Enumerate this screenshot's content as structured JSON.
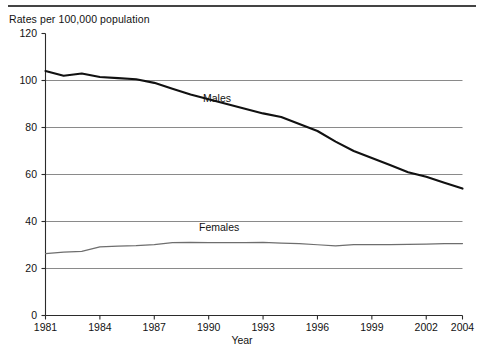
{
  "chart_data": {
    "type": "line",
    "title": "",
    "ylabel": "Rates per 100,000 population",
    "xlabel": "Year",
    "ylim": [
      0,
      120
    ],
    "xlim": [
      1981,
      2004
    ],
    "yticks": [
      0,
      20,
      40,
      60,
      80,
      100,
      120
    ],
    "xticks": [
      1981,
      1984,
      1987,
      1990,
      1993,
      1996,
      1999,
      2002,
      2004
    ],
    "xtick_labels": [
      "1981",
      "1984",
      "1987",
      "1990",
      "1993",
      "1996",
      "1999",
      "2002",
      "2004"
    ],
    "ytick_labels": [
      "0",
      "20",
      "40",
      "60",
      "80",
      "100",
      "120"
    ],
    "grid": "horizontal",
    "legend_position": "inline-annotation",
    "x": [
      1981,
      1982,
      1983,
      1984,
      1985,
      1986,
      1987,
      1988,
      1989,
      1990,
      1991,
      1992,
      1993,
      1994,
      1995,
      1996,
      1997,
      1998,
      1999,
      2000,
      2001,
      2002,
      2003,
      2004
    ],
    "series": [
      {
        "name": "Males",
        "color": "#111111",
        "width": 2.1,
        "values": [
          104,
          102,
          103,
          101.5,
          101,
          100.5,
          99,
          96.5,
          94,
          92,
          90,
          88,
          86,
          84.5,
          81.5,
          78.5,
          74,
          70,
          67,
          64,
          61,
          59,
          56.5,
          54
        ]
      },
      {
        "name": "Females",
        "color": "#6e6e6e",
        "width": 1.2,
        "values": [
          26.3,
          27,
          27.3,
          29.2,
          29.5,
          29.7,
          30.2,
          31,
          31.1,
          31,
          31,
          31,
          31.1,
          30.8,
          30.6,
          30.1,
          29.6,
          30.2,
          30.2,
          30.2,
          30.3,
          30.4,
          30.6,
          30.6
        ]
      }
    ],
    "annotations": [
      {
        "text": "Males",
        "series": "Males"
      },
      {
        "text": "Females",
        "series": "Females"
      }
    ]
  },
  "axis": {
    "y_title": "Rates per 100,000 population",
    "x_title": "Year"
  },
  "labels": {
    "males": "Males",
    "females": "Females"
  }
}
